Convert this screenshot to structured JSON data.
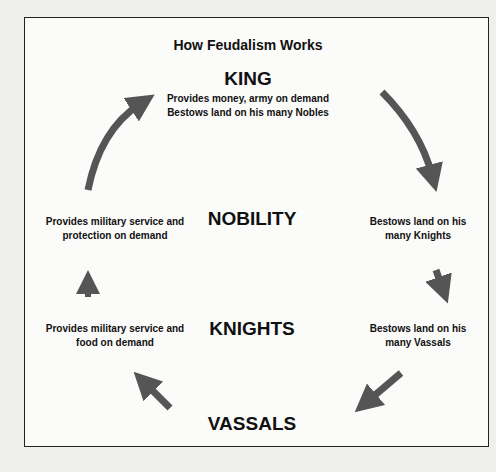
{
  "diagram": {
    "title": "How Feudalism Works",
    "levels": [
      {
        "name": "KING",
        "description": [
          "Provides money, army on demand",
          "Bestows land on his many Nobles"
        ]
      },
      {
        "name": "NOBILITY"
      },
      {
        "name": "KNIGHTS"
      },
      {
        "name": "VASSALS"
      }
    ],
    "left_notes": [
      [
        "Provides military service and",
        "protection on demand"
      ],
      [
        "Provides military service and",
        "food on demand"
      ]
    ],
    "right_notes": [
      [
        "Bestows land on his",
        "many Knights"
      ],
      [
        "Bestows land on his",
        "many Vassals"
      ]
    ],
    "arrow_color": "#555555"
  }
}
